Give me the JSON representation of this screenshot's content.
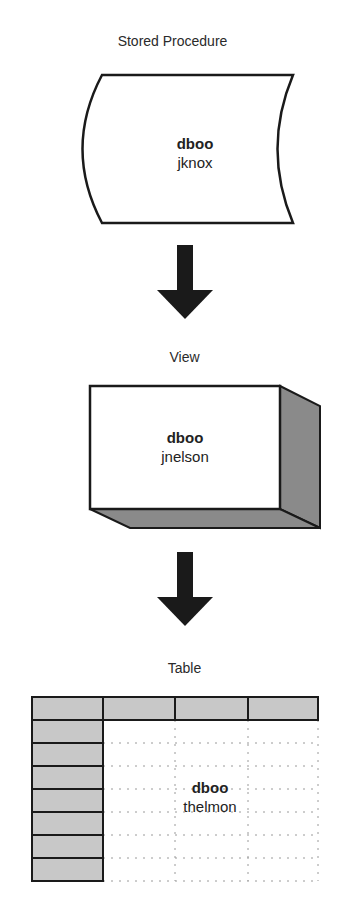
{
  "diagram": {
    "nodes": [
      {
        "id": "stored-procedure",
        "type_label": "Stored Procedure",
        "owner": "dboo",
        "name": "jknox"
      },
      {
        "id": "view",
        "type_label": "View",
        "owner": "dboo",
        "name": "jnelson"
      },
      {
        "id": "table",
        "type_label": "Table",
        "owner": "dboo",
        "name": "thelmon"
      }
    ],
    "edges": [
      {
        "from": "stored-procedure",
        "to": "view"
      },
      {
        "from": "view",
        "to": "table"
      }
    ]
  },
  "colors": {
    "stroke": "#1a1a1a",
    "shade": "#8a8a8a",
    "header_fill": "#c8c8c8",
    "grid_dots": "#9a9a9a"
  }
}
